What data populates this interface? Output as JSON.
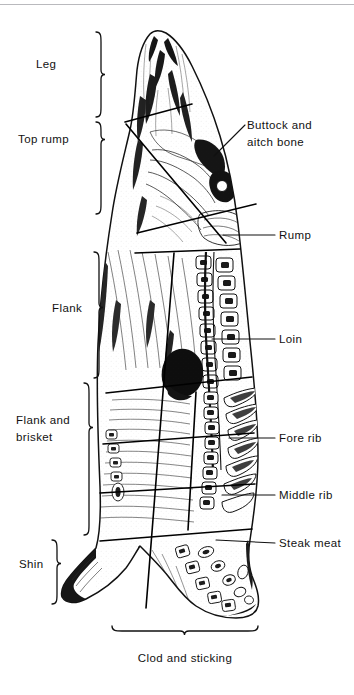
{
  "figure": {
    "type": "anatomical-diagram",
    "line_color": "#111111",
    "background_color": "#ffffff",
    "top_rule": true
  },
  "left_labels": [
    {
      "key": "leg",
      "text": "Leg",
      "x": 36,
      "y": 64,
      "bracket": {
        "x": 100,
        "top": 32,
        "bottom": 117
      }
    },
    {
      "key": "top_rump",
      "text": "Top rump",
      "x": 18,
      "y": 140,
      "bracket": {
        "x": 100,
        "top": 122,
        "bottom": 214
      }
    },
    {
      "key": "flank",
      "text": "Flank",
      "x": 52,
      "y": 308,
      "bracket": {
        "x": 98,
        "top": 252,
        "bottom": 378
      }
    },
    {
      "key": "flank_brisket_1",
      "text": "Flank and",
      "x": 16,
      "y": 420,
      "bracket": {
        "x": 88,
        "top": 383,
        "bottom": 535
      }
    },
    {
      "key": "flank_brisket_2",
      "text": "brisket",
      "x": 16,
      "y": 436,
      "bracket": null
    },
    {
      "key": "shin",
      "text": "Shin",
      "x": 20,
      "y": 565,
      "bracket": {
        "x": 56,
        "top": 540,
        "bottom": 604
      }
    }
  ],
  "right_labels": [
    {
      "key": "buttock_1",
      "text": "Buttock and",
      "x": 247,
      "y": 126,
      "leader": {
        "x1": 244,
        "y1": 128,
        "x2": 216,
        "y2": 154
      }
    },
    {
      "key": "buttock_2",
      "text": "aitch bone",
      "x": 247,
      "y": 143,
      "leader": null
    },
    {
      "key": "rump",
      "text": "Rump",
      "x": 279,
      "y": 238,
      "leader": {
        "x1": 274,
        "y1": 238,
        "x2": 224,
        "y2": 238
      }
    },
    {
      "key": "loin",
      "text": "Loin",
      "x": 279,
      "y": 342,
      "leader": {
        "x1": 274,
        "y1": 342,
        "x2": 213,
        "y2": 342
      }
    },
    {
      "key": "fore_rib",
      "text": "Fore rib",
      "x": 279,
      "y": 441,
      "leader": {
        "x1": 274,
        "y1": 441,
        "x2": 229,
        "y2": 441
      }
    },
    {
      "key": "middle_rib",
      "text": "Middle rib",
      "x": 279,
      "y": 498,
      "leader": {
        "x1": 274,
        "y1": 498,
        "x2": 222,
        "y2": 498
      }
    },
    {
      "key": "steak_meat",
      "text": "Steak meat",
      "x": 279,
      "y": 546,
      "leader": {
        "x1": 274,
        "y1": 546,
        "x2": 216,
        "y2": 543
      }
    }
  ],
  "bottom_label": {
    "key": "clod_sticking",
    "text": "Clod and sticking",
    "x": 185,
    "y": 658,
    "bracket": {
      "y": 632,
      "left": 112,
      "right": 258
    }
  },
  "cut_lines": [
    {
      "key": "leg-toprump",
      "x1": 125,
      "y1": 122,
      "x2": 170,
      "y2": 110
    },
    {
      "key": "toprump-flank",
      "x1": 138,
      "y1": 232,
      "x2": 253,
      "y2": 205
    },
    {
      "key": "flank-rump",
      "x1": 136,
      "y1": 252,
      "x2": 238,
      "y2": 250
    },
    {
      "key": "flank-brisket",
      "x1": 108,
      "y1": 392,
      "x2": 248,
      "y2": 378
    },
    {
      "key": "forerib-middlerib",
      "x1": 104,
      "y1": 443,
      "x2": 250,
      "y2": 434
    },
    {
      "key": "middlerib-steak",
      "x1": 100,
      "y1": 492,
      "x2": 252,
      "y2": 485
    },
    {
      "key": "steak-clod",
      "x1": 102,
      "y1": 540,
      "x2": 250,
      "y2": 530
    }
  ]
}
